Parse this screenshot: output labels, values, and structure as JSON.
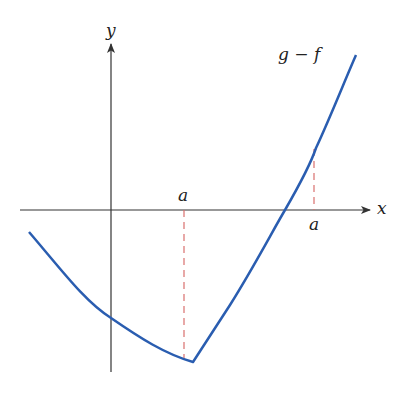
{
  "diagram": {
    "axes": {
      "x_label": "x",
      "y_label": "y",
      "axis_color": "#333333"
    },
    "curve": {
      "label": "g − f",
      "color": "#2a5db0"
    },
    "markers": [
      {
        "label": "a",
        "position": "above-axis-left"
      },
      {
        "label": "a",
        "position": "below-axis-right"
      }
    ],
    "dashed_color": "#d9706e"
  }
}
